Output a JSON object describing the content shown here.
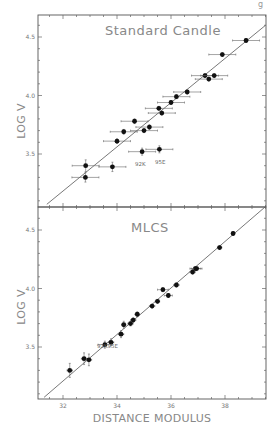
{
  "chart_data": [
    {
      "type": "scatter",
      "title": "Standard Candle",
      "xlabel": "DISTANCE MODULUS",
      "ylabel": "LOG V",
      "xlim": [
        31.07,
        39.5
      ],
      "ylim": [
        3.07,
        4.7
      ],
      "x_ticks": [
        32,
        34,
        36,
        38
      ],
      "y_ticks": [
        3.5,
        4.0,
        4.5
      ],
      "y_tick_labels": [
        "3.5",
        "4.0",
        "4.5"
      ],
      "grid": false,
      "fit_line": {
        "x": [
          31.4,
          39.5
        ],
        "y": [
          3.07,
          4.6
        ]
      },
      "points": [
        {
          "x": 38.78,
          "y": 4.47,
          "xerr": 0.5,
          "yerr": 0.01
        },
        {
          "x": 37.9,
          "y": 4.35,
          "xerr": 0.5,
          "yerr": 0.01
        },
        {
          "x": 37.26,
          "y": 4.17,
          "xerr": 0.5,
          "yerr": 0.01
        },
        {
          "x": 37.6,
          "y": 4.17,
          "xerr": 0.5,
          "yerr": 0.01
        },
        {
          "x": 37.4,
          "y": 4.14,
          "xerr": 0.5,
          "yerr": 0.01
        },
        {
          "x": 36.6,
          "y": 4.03,
          "xerr": 0.5,
          "yerr": 0.01
        },
        {
          "x": 36.2,
          "y": 3.99,
          "xerr": 0.5,
          "yerr": 0.01
        },
        {
          "x": 36.0,
          "y": 3.94,
          "xerr": 0.5,
          "yerr": 0.01
        },
        {
          "x": 35.55,
          "y": 3.89,
          "xerr": 0.5,
          "yerr": 0.01
        },
        {
          "x": 35.66,
          "y": 3.85,
          "xerr": 0.5,
          "yerr": 0.01
        },
        {
          "x": 34.65,
          "y": 3.78,
          "xerr": 0.5,
          "yerr": 0.02
        },
        {
          "x": 35.2,
          "y": 3.73,
          "xerr": 0.5,
          "yerr": 0.02
        },
        {
          "x": 35.0,
          "y": 3.7,
          "xerr": 0.5,
          "yerr": 0.01
        },
        {
          "x": 34.25,
          "y": 3.69,
          "xerr": 0.5,
          "yerr": 0.02
        },
        {
          "x": 34.0,
          "y": 3.61,
          "xerr": 0.5,
          "yerr": 0.02
        },
        {
          "x": 34.93,
          "y": 3.52,
          "xerr": 0.5,
          "yerr": 0.03,
          "label": "92K"
        },
        {
          "x": 35.57,
          "y": 3.54,
          "xerr": 0.5,
          "yerr": 0.03,
          "label": "95E"
        },
        {
          "x": 32.84,
          "y": 3.4,
          "xerr": 0.5,
          "yerr": 0.05
        },
        {
          "x": 33.83,
          "y": 3.39,
          "xerr": 0.5,
          "yerr": 0.04
        },
        {
          "x": 32.83,
          "y": 3.3,
          "xerr": 0.5,
          "yerr": 0.04
        }
      ]
    },
    {
      "type": "scatter",
      "title": "MLCS",
      "xlabel": "DISTANCE MODULUS",
      "ylabel": "LOG V",
      "xlim": [
        31.07,
        39.5
      ],
      "ylim": [
        3.07,
        4.7
      ],
      "x_ticks": [
        32,
        34,
        36,
        38
      ],
      "x_tick_labels": [
        "32",
        "34",
        "36",
        "38"
      ],
      "y_ticks": [
        3.5,
        4.0,
        4.5
      ],
      "y_tick_labels": [
        "3.5",
        "4.0",
        "4.5"
      ],
      "grid": false,
      "fit_line": {
        "x": [
          31.3,
          39.5
        ],
        "y": [
          3.07,
          4.7
        ]
      },
      "annotation": "92K95E",
      "points": [
        {
          "x": 38.3,
          "y": 4.47,
          "xerr": 0.05,
          "yerr": 0.01
        },
        {
          "x": 37.8,
          "y": 4.35,
          "xerr": 0.08,
          "yerr": 0.01
        },
        {
          "x": 36.9,
          "y": 4.17,
          "xerr": 0.2,
          "yerr": 0.01
        },
        {
          "x": 36.95,
          "y": 4.17,
          "xerr": 0.2,
          "yerr": 0.01
        },
        {
          "x": 36.8,
          "y": 4.14,
          "xerr": 0.1,
          "yerr": 0.01
        },
        {
          "x": 36.2,
          "y": 4.03,
          "xerr": 0.1,
          "yerr": 0.01
        },
        {
          "x": 35.7,
          "y": 3.99,
          "xerr": 0.2,
          "yerr": 0.01
        },
        {
          "x": 35.9,
          "y": 3.94,
          "xerr": 0.15,
          "yerr": 0.01
        },
        {
          "x": 35.5,
          "y": 3.89,
          "xerr": 0.08,
          "yerr": 0.01
        },
        {
          "x": 35.3,
          "y": 3.85,
          "xerr": 0.1,
          "yerr": 0.01
        },
        {
          "x": 34.75,
          "y": 3.78,
          "xerr": 0.08,
          "yerr": 0.02
        },
        {
          "x": 34.6,
          "y": 3.73,
          "xerr": 0.1,
          "yerr": 0.02
        },
        {
          "x": 34.5,
          "y": 3.7,
          "xerr": 0.1,
          "yerr": 0.02
        },
        {
          "x": 34.25,
          "y": 3.69,
          "xerr": 0.08,
          "yerr": 0.03
        },
        {
          "x": 34.15,
          "y": 3.61,
          "xerr": 0.1,
          "yerr": 0.03
        },
        {
          "x": 33.78,
          "y": 3.54,
          "xerr": 0.1,
          "yerr": 0.03
        },
        {
          "x": 33.55,
          "y": 3.52,
          "xerr": 0.25,
          "yerr": 0.03
        },
        {
          "x": 32.78,
          "y": 3.4,
          "xerr": 0.1,
          "yerr": 0.05
        },
        {
          "x": 32.96,
          "y": 3.39,
          "xerr": 0.1,
          "yerr": 0.05
        },
        {
          "x": 32.25,
          "y": 3.3,
          "xerr": 0.1,
          "yerr": 0.06
        }
      ]
    }
  ],
  "panels": {
    "top": {
      "title": "Standard Candle",
      "ylabel": "LOG V",
      "annotations": [
        "92K",
        "95E"
      ]
    },
    "bottom": {
      "title": "MLCS",
      "ylabel": "LOG V",
      "annotation": "92K95E",
      "xlabel": "DISTANCE MODULUS"
    }
  },
  "page_mark": "g"
}
